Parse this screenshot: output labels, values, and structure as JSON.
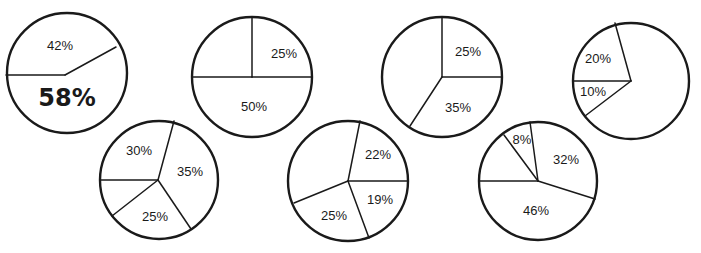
{
  "chart_data": [
    {
      "type": "pie",
      "id": "pie-1",
      "center": [
        67,
        73
      ],
      "radius": 60,
      "hub": [
        65,
        75
      ],
      "divider_ends": [
        [
          6,
          75
        ],
        [
          116,
          47
        ]
      ],
      "slices": [
        {
          "label": "42%",
          "value": 42,
          "pos": [
            60,
            47
          ],
          "emphasis": false
        },
        {
          "label": "58%",
          "value": 58,
          "pos": [
            67,
            99
          ],
          "emphasis": true
        }
      ]
    },
    {
      "type": "pie",
      "id": "pie-2",
      "center": [
        252,
        77
      ],
      "radius": 60,
      "hub": [
        252,
        77
      ],
      "divider_ends": [
        [
          252,
          17
        ],
        [
          312,
          77
        ],
        [
          192,
          77
        ]
      ],
      "slices": [
        {
          "label": "25%",
          "value": 25,
          "pos": [
            284,
            55
          ],
          "emphasis": false
        },
        {
          "label": "50%",
          "value": 50,
          "pos": [
            254,
            108
          ],
          "emphasis": false
        },
        {
          "label": "",
          "value": 25,
          "pos": [
            222,
            50
          ],
          "emphasis": false
        }
      ]
    },
    {
      "type": "pie",
      "id": "pie-3",
      "center": [
        442,
        77
      ],
      "radius": 60,
      "hub": [
        442,
        77
      ],
      "divider_ends": [
        [
          442,
          17
        ],
        [
          501,
          77
        ],
        [
          410,
          126
        ]
      ],
      "slices": [
        {
          "label": "25%",
          "value": 25,
          "pos": [
            468,
            53
          ],
          "emphasis": false
        },
        {
          "label": "35%",
          "value": 35,
          "pos": [
            458,
            109
          ],
          "emphasis": false
        },
        {
          "label": "",
          "value": 40,
          "pos": [
            410,
            70
          ],
          "emphasis": false
        }
      ]
    },
    {
      "type": "pie",
      "id": "pie-4",
      "center": [
        631,
        81
      ],
      "radius": 58,
      "hub": [
        631,
        81
      ],
      "divider_ends": [
        [
          615,
          23
        ],
        [
          573,
          81
        ],
        [
          585,
          116
        ]
      ],
      "slices": [
        {
          "label": "20%",
          "value": 20,
          "pos": [
            598,
            60
          ],
          "emphasis": false
        },
        {
          "label": "10%",
          "value": 10,
          "pos": [
            593,
            93
          ],
          "emphasis": false
        },
        {
          "label": "",
          "value": 70,
          "pos": [
            660,
            80
          ],
          "emphasis": false
        }
      ]
    },
    {
      "type": "pie",
      "id": "pie-5",
      "center": [
        159,
        180
      ],
      "radius": 59,
      "hub": [
        158,
        180
      ],
      "divider_ends": [
        [
          174,
          121
        ],
        [
          100,
          180
        ],
        [
          112,
          216
        ],
        [
          191,
          229
        ]
      ],
      "slices": [
        {
          "label": "30%",
          "value": 30,
          "pos": [
            139,
            152
          ],
          "emphasis": false
        },
        {
          "label": "35%",
          "value": 35,
          "pos": [
            190,
            173
          ],
          "emphasis": false
        },
        {
          "label": "25%",
          "value": 25,
          "pos": [
            155,
            218
          ],
          "emphasis": false
        },
        {
          "label": "",
          "value": 10,
          "pos": [
            118,
            195
          ],
          "emphasis": false
        }
      ]
    },
    {
      "type": "pie",
      "id": "pie-6",
      "center": [
        348,
        181
      ],
      "radius": 60,
      "hub": [
        348,
        181
      ],
      "divider_ends": [
        [
          360,
          121
        ],
        [
          408,
          181
        ],
        [
          369,
          238
        ],
        [
          294,
          203
        ]
      ],
      "slices": [
        {
          "label": "22%",
          "value": 22,
          "pos": [
            378,
            156
          ],
          "emphasis": false
        },
        {
          "label": "19%",
          "value": 19,
          "pos": [
            380,
            201
          ],
          "emphasis": false
        },
        {
          "label": "25%",
          "value": 25,
          "pos": [
            334,
            217
          ],
          "emphasis": false
        },
        {
          "label": "",
          "value": 34,
          "pos": [
            315,
            165
          ],
          "emphasis": false
        }
      ]
    },
    {
      "type": "pie",
      "id": "pie-7",
      "center": [
        538,
        181
      ],
      "radius": 59,
      "hub": [
        538,
        181
      ],
      "divider_ends": [
        [
          530,
          122
        ],
        [
          504,
          135
        ],
        [
          479,
          181
        ],
        [
          595,
          199
        ]
      ],
      "slices": [
        {
          "label": "8%",
          "value": 8,
          "pos": [
            522,
            141
          ],
          "emphasis": false
        },
        {
          "label": "32%",
          "value": 32,
          "pos": [
            566,
            161
          ],
          "emphasis": false
        },
        {
          "label": "46%",
          "value": 46,
          "pos": [
            536,
            212
          ],
          "emphasis": false
        },
        {
          "label": "",
          "value": 14,
          "pos": [
            505,
            165
          ],
          "emphasis": false
        }
      ]
    }
  ],
  "colors": {
    "stroke": "#1a1a1a",
    "fill": "#ffffff",
    "background": "#ffffff"
  }
}
